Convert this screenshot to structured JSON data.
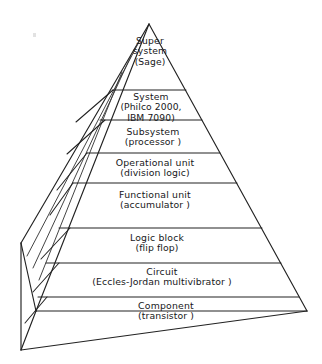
{
  "figure": {
    "type": "hierarchy-pyramid",
    "title": "",
    "orientation": "apex-up",
    "faces": [
      "front",
      "left-side"
    ],
    "tier_count": 8,
    "colors": {
      "background": "#ffffff",
      "stroke": "#222222",
      "text": "#17171a"
    }
  },
  "tiers": [
    {
      "index": 1,
      "level": "Super system",
      "example": "(Sage)",
      "lines": [
        "Super",
        "system",
        "(Sage)"
      ]
    },
    {
      "index": 2,
      "level": "System",
      "example": "(Philco 2000, IBM 7090)",
      "lines": [
        "System",
        "(Philco 2000,",
        "IBM 7090)"
      ]
    },
    {
      "index": 3,
      "level": "Subsystem",
      "example": "(processor)",
      "lines": [
        "Subsystem",
        "(processor )"
      ]
    },
    {
      "index": 4,
      "level": "Operational unit",
      "example": "(division logic)",
      "lines": [
        "Operational unit",
        "(division logic)"
      ]
    },
    {
      "index": 5,
      "level": "Functional unit",
      "example": "(accumulator)",
      "lines": [
        "Functional unit",
        "(accumulator )"
      ]
    },
    {
      "index": 6,
      "level": "Logic block",
      "example": "(flip flop)",
      "lines": [
        "Logic block",
        "(flip flop)"
      ]
    },
    {
      "index": 7,
      "level": "Circuit",
      "example": "(Eccles-Jordan multivibrator)",
      "lines": [
        "Circuit",
        "(Eccles-Jordan multivibrator )"
      ]
    },
    {
      "index": 8,
      "level": "Component",
      "example": "(transistor)",
      "lines": [
        "Component",
        "(transistor )"
      ]
    }
  ]
}
